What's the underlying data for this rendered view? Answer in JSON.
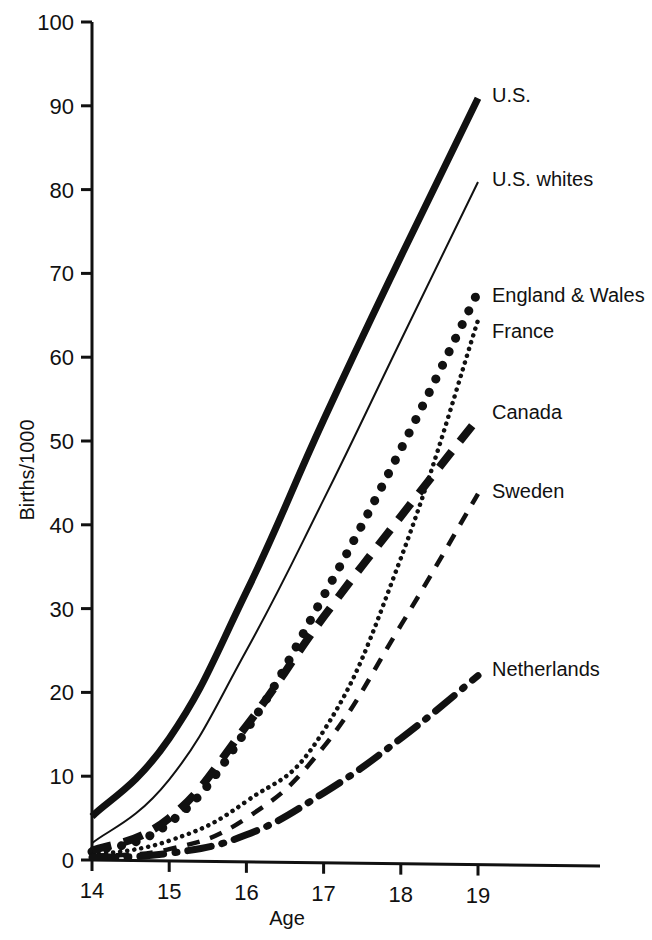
{
  "chart_data": {
    "type": "line",
    "title": "",
    "subtitle": "",
    "xlabel": "Age",
    "ylabel": "Births/1000",
    "x": [
      14,
      15,
      16,
      17,
      18,
      19
    ],
    "xlim": [
      14,
      19
    ],
    "ylim": [
      0,
      100
    ],
    "xticks": [
      "14",
      "15",
      "16",
      "17",
      "18",
      "19"
    ],
    "yticks": [
      "0",
      "10",
      "20",
      "30",
      "40",
      "50",
      "60",
      "70",
      "80",
      "90",
      "100"
    ],
    "grid": false,
    "legend_position": "right-inline-labels",
    "series": [
      {
        "name": "U.S.",
        "style": "thick-solid",
        "label_y_value": 91,
        "values": [
          5.2,
          14.5,
          32.0,
          52.5,
          72.0,
          90.9
        ]
      },
      {
        "name": "U.S. whites",
        "style": "thin-solid",
        "label_y_value": 81,
        "values": [
          2.0,
          9.6,
          25.0,
          43.0,
          62.0,
          80.9
        ]
      },
      {
        "name": "England & Wales",
        "style": "large-dotted",
        "label_y_value": 67.8,
        "values": [
          1.0,
          4.4,
          15.5,
          31.5,
          49.0,
          67.8
        ]
      },
      {
        "name": "France",
        "style": "fine-dotted",
        "label_y_value": 64.4,
        "values": [
          0.6,
          2.3,
          7.0,
          15.4,
          36.0,
          64.4
        ]
      },
      {
        "name": "Canada",
        "style": "long-dash",
        "label_y_value": 52.7,
        "values": [
          1.1,
          5.0,
          16.0,
          29.0,
          41.0,
          52.7
        ]
      },
      {
        "name": "Sweden",
        "style": "short-dash",
        "label_y_value": 43.7,
        "values": [
          0.5,
          1.3,
          5.0,
          13.5,
          28.0,
          43.7
        ]
      },
      {
        "name": "Netherlands",
        "style": "dash-dot",
        "label_y_value": 22.0,
        "values": [
          0.3,
          0.8,
          3.0,
          8.0,
          14.5,
          22.0
        ]
      }
    ]
  },
  "axes": {
    "y_title": "Births/1000",
    "x_title": "Age",
    "y_ticks": [
      {
        "label": "100",
        "value": 100
      },
      {
        "label": "90",
        "value": 90
      },
      {
        "label": "80",
        "value": 80
      },
      {
        "label": "70",
        "value": 70
      },
      {
        "label": "60",
        "value": 60
      },
      {
        "label": "50",
        "value": 50
      },
      {
        "label": "40",
        "value": 40
      },
      {
        "label": "30",
        "value": 30
      },
      {
        "label": "20",
        "value": 20
      },
      {
        "label": "10",
        "value": 10
      },
      {
        "label": "0",
        "value": 0
      }
    ],
    "x_ticks": [
      {
        "label": "14",
        "value": 14
      },
      {
        "label": "15",
        "value": 15
      },
      {
        "label": "16",
        "value": 16
      },
      {
        "label": "17",
        "value": 17
      },
      {
        "label": "18",
        "value": 18
      },
      {
        "label": "19",
        "value": 19
      }
    ]
  },
  "series_labels": [
    {
      "name": "U.S.",
      "x": 492,
      "y": 102
    },
    {
      "name": "U.S. whites",
      "x": 492,
      "y": 186
    },
    {
      "name": "England & Wales",
      "x": 492,
      "y": 302
    },
    {
      "name": "France",
      "x": 492,
      "y": 338
    },
    {
      "name": "Canada",
      "x": 492,
      "y": 419
    },
    {
      "name": "Sweden",
      "x": 492,
      "y": 498
    },
    {
      "name": "Netherlands",
      "x": 492,
      "y": 676
    }
  ],
  "colors": {
    "ink": "#111111",
    "background": "#ffffff"
  }
}
